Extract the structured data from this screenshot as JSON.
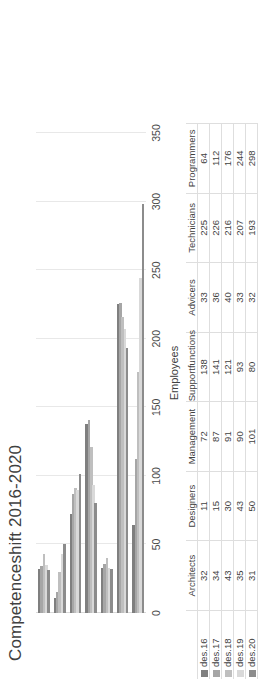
{
  "chart_data": {
    "type": "bar",
    "orientation": "horizontal",
    "title": "Competenceshift 2016-2020",
    "xlabel": "Employees",
    "ylabel": "",
    "axis_title": "Employees",
    "xlim": [
      0,
      350
    ],
    "ticks": [
      "0",
      "50",
      "100",
      "150",
      "200",
      "250",
      "300",
      "350"
    ],
    "grid": true,
    "legend_position": "data-table",
    "has_data_table": true,
    "categories": [
      "Architects",
      "Designers",
      "Management",
      "Supportfunctions",
      "Advicers",
      "Technicians",
      "Programmers"
    ],
    "series": [
      {
        "name": "des.16",
        "color": "#7f7f7f",
        "values": [
          32,
          11,
          72,
          138,
          33,
          225,
          64
        ]
      },
      {
        "name": "des.17",
        "color": "#a6a6a6",
        "values": [
          34,
          15,
          87,
          141,
          36,
          226,
          112
        ]
      },
      {
        "name": "des.18",
        "color": "#bfbfbf",
        "values": [
          43,
          30,
          91,
          121,
          40,
          216,
          176
        ]
      },
      {
        "name": "des.19",
        "color": "#d9d9d9",
        "values": [
          35,
          43,
          90,
          93,
          33,
          207,
          244
        ]
      },
      {
        "name": "des.20",
        "color": "#8c8c8c",
        "values": [
          31,
          50,
          101,
          80,
          32,
          193,
          298
        ]
      }
    ]
  },
  "table": {
    "header_blank": "",
    "columns": [
      "Architects",
      "Designers",
      "Management",
      "Supportfunctions",
      "Advicers",
      "Technicians",
      "Programmers"
    ],
    "rows": [
      {
        "label": "des.16",
        "cells": [
          "32",
          "11",
          "72",
          "138",
          "33",
          "225",
          "64"
        ]
      },
      {
        "label": "des.17",
        "cells": [
          "34",
          "15",
          "87",
          "141",
          "36",
          "226",
          "112"
        ]
      },
      {
        "label": "des.18",
        "cells": [
          "43",
          "30",
          "91",
          "121",
          "40",
          "216",
          "176"
        ]
      },
      {
        "label": "des.19",
        "cells": [
          "35",
          "43",
          "90",
          "93",
          "33",
          "207",
          "244"
        ]
      },
      {
        "label": "des.20",
        "cells": [
          "31",
          "50",
          "101",
          "80",
          "32",
          "193",
          "298"
        ]
      }
    ]
  }
}
